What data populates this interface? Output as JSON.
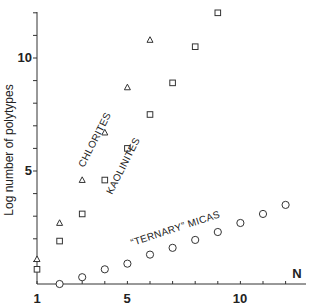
{
  "chart_data": {
    "type": "scatter",
    "title": "",
    "xlabel": "N",
    "ylabel": "Log number of polytypes",
    "xlim": [
      1,
      13
    ],
    "ylim": [
      0,
      12.5
    ],
    "x_ticks": [
      1,
      5,
      10
    ],
    "y_ticks": [
      5,
      10
    ],
    "grid": false,
    "legend": "none (series labeled inline)",
    "series": [
      {
        "name": "CHLORITES",
        "marker": "triangle",
        "x": [
          1,
          2,
          3,
          4,
          5,
          6
        ],
        "y": [
          1.1,
          2.7,
          4.6,
          6.7,
          8.7,
          10.8
        ]
      },
      {
        "name": "KAOLINITES",
        "marker": "square",
        "x": [
          1,
          2,
          3,
          4,
          5,
          6,
          7,
          8,
          9
        ],
        "y": [
          0.65,
          1.9,
          3.1,
          4.6,
          6.0,
          7.5,
          8.9,
          10.5,
          12.0
        ]
      },
      {
        "name": "\"TERNARY\" MICAS",
        "marker": "circle",
        "x": [
          2,
          3,
          4,
          5,
          6,
          7,
          8,
          9,
          10,
          11,
          12
        ],
        "y": [
          0.0,
          0.3,
          0.65,
          0.9,
          1.3,
          1.6,
          1.95,
          2.3,
          2.7,
          3.1,
          3.5
        ]
      }
    ],
    "annotations": [
      {
        "text": "CHLORITES",
        "near": "triangle series, N≈3-4"
      },
      {
        "text": "KAOLINITES",
        "near": "square series, N≈4-5"
      },
      {
        "text": "\"TERNARY\" MICAS",
        "near": "circle series, N≈5-8"
      }
    ]
  },
  "labels": {
    "x_tick_1": "1",
    "x_tick_5": "5",
    "x_tick_10": "10",
    "y_tick_5": "5",
    "y_tick_10": "10",
    "x_axis": "N",
    "y_axis": "Log number of polytypes",
    "chlorites": "CHLORITES",
    "kaolinites": "KAOLINITES",
    "micas": "“TERNARY” MICAS"
  }
}
